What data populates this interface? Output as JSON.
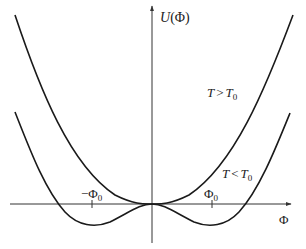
{
  "diagram": {
    "y_axis_label": "U(Φ)",
    "y_axis_label_parts": {
      "main": "U",
      "paren_open": "(",
      "var": "Φ",
      "paren_close": ")"
    },
    "x_axis_label": "Φ",
    "ticks": [
      {
        "label": "−Φ",
        "sub": "0",
        "position": "negative"
      },
      {
        "label": "Φ",
        "sub": "0",
        "position": "positive"
      }
    ],
    "curves": [
      {
        "name": "high-temperature",
        "label_T": "T",
        "label_op": ">",
        "label_T0": "T",
        "label_sub": "0",
        "shape": "single minimum at Φ=0"
      },
      {
        "name": "low-temperature",
        "label_T": "T",
        "label_op": "<",
        "label_T0": "T",
        "label_sub": "0",
        "shape": "double well, minima at ±Φ0"
      }
    ],
    "colors": {
      "curve": "#1a1a1a",
      "axis": "#333333",
      "background": "#ffffff"
    }
  }
}
